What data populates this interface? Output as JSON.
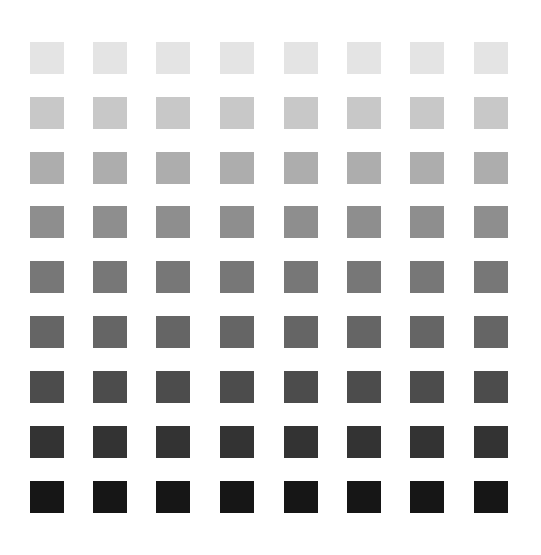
{
  "grid": {
    "rows": 9,
    "cols": 8,
    "col_x": [
      30,
      93,
      156,
      220,
      284,
      347,
      410,
      474
    ],
    "row_y": [
      42,
      97,
      152,
      206,
      261,
      316,
      371,
      426,
      481
    ],
    "swatch_w": 34,
    "swatch_h": 32,
    "row_colors": [
      "#e4e4e4",
      "#c8c8c8",
      "#adadad",
      "#8e8e8e",
      "#777777",
      "#656565",
      "#4c4c4c",
      "#333333",
      "#161616"
    ]
  }
}
